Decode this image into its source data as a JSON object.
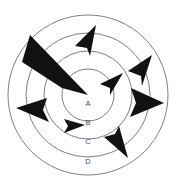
{
  "diagram": {
    "background_color": "#ffffff",
    "ring_stroke_color": "#6e6e6e",
    "marker_color": "#111111",
    "label_color": "#4a4a4a",
    "center": {
      "x": 88,
      "y": 95
    },
    "rings": [
      {
        "id": "ring-a",
        "label": "A",
        "radius": 26,
        "label_x": 88,
        "label_y": 104
      },
      {
        "id": "ring-b",
        "label": "B",
        "radius": 44,
        "label_x": 88,
        "label_y": 123
      },
      {
        "id": "ring-c",
        "label": "C",
        "radius": 62,
        "label_x": 88,
        "label_y": 142
      },
      {
        "id": "ring-d",
        "label": "D",
        "radius": 80,
        "label_x": 88,
        "label_y": 162
      }
    ],
    "wedge": {
      "id": "large-wedge",
      "description": "large solid black wedge from center toward upper-left",
      "points": "88,95 30,35 22,62 62,88"
    },
    "markers": [
      {
        "id": "arrow-top",
        "direction": "up-left",
        "points": "96,25 75,46 87,48 90,56"
      },
      {
        "id": "arrow-upper-right",
        "direction": "down-left",
        "points": "152,55 128,71 141,76 142,86"
      },
      {
        "id": "arrow-inner-right",
        "direction": "up-right",
        "points": "123,73 100,84 110,88 110,95"
      },
      {
        "id": "arrow-right",
        "direction": "right",
        "points": "164,103 131,88 136,103 130,117"
      },
      {
        "id": "arrow-left",
        "direction": "left",
        "points": "16,108 47,98 43,110 49,122"
      },
      {
        "id": "arrow-inner-lower",
        "direction": "right",
        "points": "85,125 64,119 68,126 64,133"
      },
      {
        "id": "arrow-lower-right",
        "direction": "down-right",
        "points": "128,158 104,137 115,134 119,126"
      }
    ]
  }
}
